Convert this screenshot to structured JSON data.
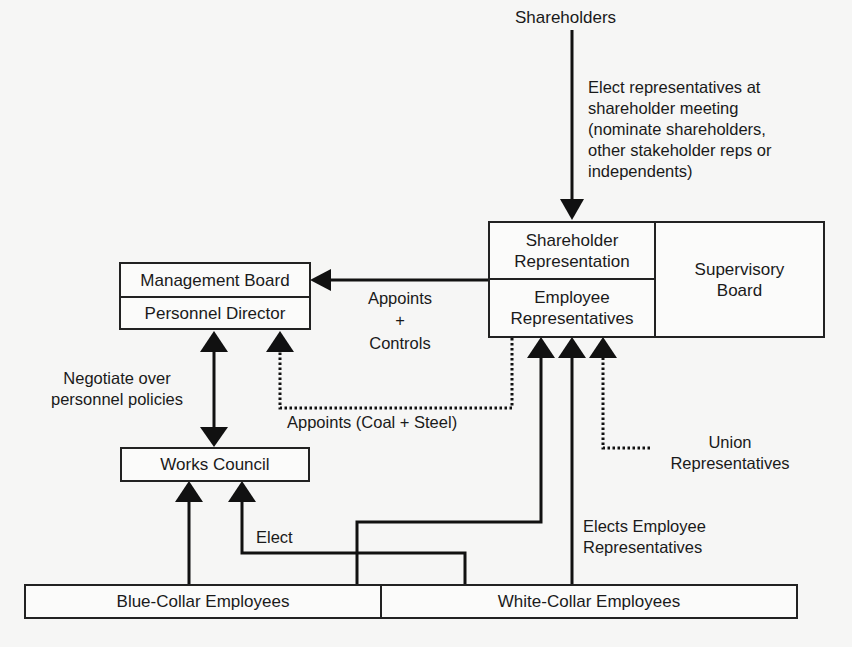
{
  "nodes": {
    "shareholders": "Shareholders",
    "shareholder_representation": "Shareholder Representation",
    "employee_representatives": "Employee Representatives",
    "supervisory_board": "Supervisory Board",
    "management_board": "Management Board",
    "personnel_director": "Personnel Director",
    "works_council": "Works Council",
    "blue_collar": "Blue-Collar Employees",
    "white_collar": "White-Collar Employees",
    "union_representatives": "Union Representatives"
  },
  "edges": {
    "elect_shareholder_reps": "Elect representatives at shareholder meeting (nominate shareholders, other stakeholder reps or independents)",
    "appoints_controls_1": "Appoints",
    "appoints_controls_2": "+",
    "appoints_controls_3": "Controls",
    "appoints_coal_steel": "Appoints (Coal + Steel)",
    "negotiate": "Negotiate over personnel policies",
    "elect": "Elect",
    "elects_employee_reps": "Elects Employee Representatives"
  },
  "colors": {
    "line": "#111111",
    "background": "#f6f6f5"
  }
}
